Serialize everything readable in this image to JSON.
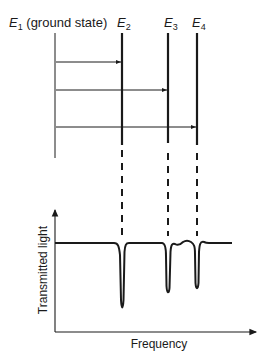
{
  "diagram": {
    "levels": [
      {
        "name": "E",
        "sub": "1",
        "suffix": " (ground state)"
      },
      {
        "name": "E",
        "sub": "2",
        "suffix": ""
      },
      {
        "name": "E",
        "sub": "3",
        "suffix": ""
      },
      {
        "name": "E",
        "sub": "4",
        "suffix": ""
      }
    ],
    "transitions": [
      {
        "from": "E1",
        "to": "E2"
      },
      {
        "from": "E1",
        "to": "E3"
      },
      {
        "from": "E1",
        "to": "E4"
      }
    ],
    "spectrum": {
      "ylabel": "Transmitted light",
      "xlabel": "Frequency",
      "absorption_dips": [
        {
          "level": "E2",
          "relative_depth": 1.0
        },
        {
          "level": "E3",
          "relative_depth": 0.75
        },
        {
          "level": "E4",
          "relative_depth": 0.7
        }
      ]
    },
    "colors": {
      "ink": "#1a1a1a",
      "background": "#ffffff"
    }
  }
}
